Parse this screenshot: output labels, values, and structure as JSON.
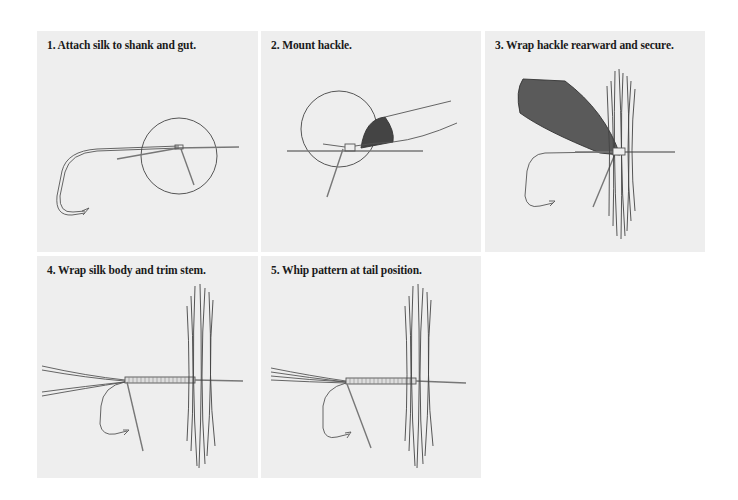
{
  "figure": {
    "background": "#ffffff",
    "panel_background": "#eeeeee",
    "line_color": "#555555",
    "steps": [
      {
        "number": 1,
        "title": "1. Attach silk to shank and gut."
      },
      {
        "number": 2,
        "title": "2. Mount hackle."
      },
      {
        "number": 3,
        "title": "3. Wrap hackle rearward and secure."
      },
      {
        "number": 4,
        "title": "4. Wrap silk body and trim stem."
      },
      {
        "number": 5,
        "title": "5. Whip pattern at tail position."
      }
    ]
  }
}
